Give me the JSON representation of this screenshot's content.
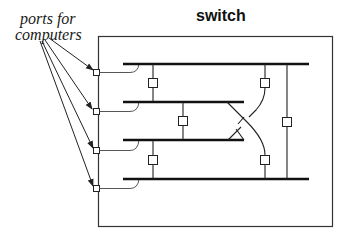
{
  "diagram": {
    "title": "switch",
    "annotation_line1": "ports for",
    "annotation_line2": "computers",
    "colors": {
      "stroke": "#222222",
      "background": "#ffffff"
    },
    "box": {
      "x": 98,
      "y": 36,
      "width": 235,
      "height": 191
    },
    "ports": [
      {
        "name": "port-1",
        "y": 73
      },
      {
        "name": "port-2",
        "y": 111
      },
      {
        "name": "port-3",
        "y": 150
      },
      {
        "name": "port-4",
        "y": 188
      }
    ],
    "buses": [
      {
        "name": "bus-1",
        "y": 64,
        "x1": 123,
        "x2": 309
      },
      {
        "name": "bus-2",
        "y": 102,
        "x1": 123,
        "x2": 244
      },
      {
        "name": "bus-3",
        "y": 140,
        "x1": 123,
        "x2": 244
      },
      {
        "name": "bus-4",
        "y": 179,
        "x1": 123,
        "x2": 309
      }
    ]
  }
}
